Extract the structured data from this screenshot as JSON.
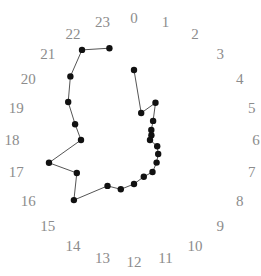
{
  "chart_data": {
    "type": "radial-line",
    "title": "",
    "angular_axis": {
      "labels": [
        "0",
        "1",
        "2",
        "3",
        "4",
        "5",
        "6",
        "7",
        "8",
        "9",
        "10",
        "11",
        "12",
        "13",
        "14",
        "15",
        "16",
        "17",
        "18",
        "19",
        "20",
        "21",
        "22",
        "23"
      ],
      "direction": "clockwise",
      "zero_at": "top"
    },
    "radial_axis": {
      "range": [
        0,
        122
      ],
      "visible": false,
      "grid": false
    },
    "series": [
      {
        "name": "series-1",
        "closed": false,
        "x": [
          0,
          1,
          2,
          3,
          4,
          5,
          6,
          7,
          8,
          9,
          10,
          11,
          12,
          13,
          14,
          15,
          16,
          17,
          18,
          19,
          20,
          21,
          22,
          23
        ],
        "values": [
          70,
          28,
          43,
          27,
          20,
          18,
          16,
          24,
          28,
          32,
          37,
          38,
          44,
          51,
          53,
          85,
          66,
          88,
          53,
          61,
          76,
          90,
          104,
          95
        ]
      }
    ],
    "colors": {
      "label": "#8c8c8c",
      "line": "#555555",
      "point": "#111111"
    },
    "layout": {
      "center": [
        134,
        140
      ],
      "label_radius": 122,
      "legend": "none"
    }
  }
}
